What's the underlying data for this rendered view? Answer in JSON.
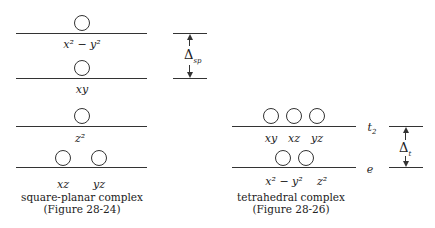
{
  "square_planar": {
    "levels": [
      {
        "label": "x² − y²"
      },
      {
        "label": "xy"
      },
      {
        "label": "z²"
      },
      {
        "labels": [
          "xz",
          "yz"
        ]
      }
    ],
    "delta_label": "Δ",
    "delta_sub": "sp",
    "caption_line1": "square-planar complex",
    "caption_line2": "(Figure 28-24)"
  },
  "tetrahedral": {
    "upper_labels": [
      "xy",
      "xz",
      "yz"
    ],
    "upper_term": "t",
    "upper_term_sub": "2",
    "lower_labels": [
      "x² − y²",
      "z²"
    ],
    "lower_term": "e",
    "delta_label": "Δ",
    "delta_sub": "t",
    "caption_line1": "tetrahedral complex",
    "caption_line2": "(Figure 28-26)"
  }
}
